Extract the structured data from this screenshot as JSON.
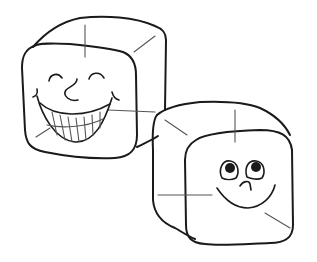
{
  "illustration": {
    "subject": "Two cartoon ice cubes with faces",
    "colors": {
      "background": "#ffffff",
      "line": "#1a1a1a",
      "highlight_line": "#555555"
    },
    "cubes": [
      {
        "name": "left cube",
        "expression": "big toothy grin with closed happy eyes"
      },
      {
        "name": "right cube",
        "expression": "gentle smile with eyes looking up"
      }
    ]
  }
}
